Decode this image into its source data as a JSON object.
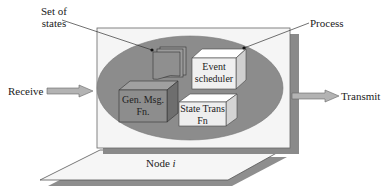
{
  "diagram": {
    "labels": {
      "set_of_states_line1": "Set of",
      "set_of_states_line2": "states",
      "process": "Process",
      "receive": "Receive",
      "transmit": "Transmit",
      "node": "Node ",
      "node_index": "i"
    },
    "components": {
      "event_scheduler_line1": "Event",
      "event_scheduler_line2": "scheduler",
      "gen_msg_line1": "Gen. Msg.",
      "gen_msg_line2": "Fn.",
      "state_trans_line1": "State Trans",
      "state_trans_line2": "Fn"
    },
    "colors": {
      "ellipse": "#8c8c8c",
      "box_face": "#f4f4f4",
      "box_shadow": "#8a8a8a",
      "dark_cube": "#8a8a8a",
      "light_cube": "#f2f2f2",
      "arrow": "#b0b0b0"
    }
  }
}
